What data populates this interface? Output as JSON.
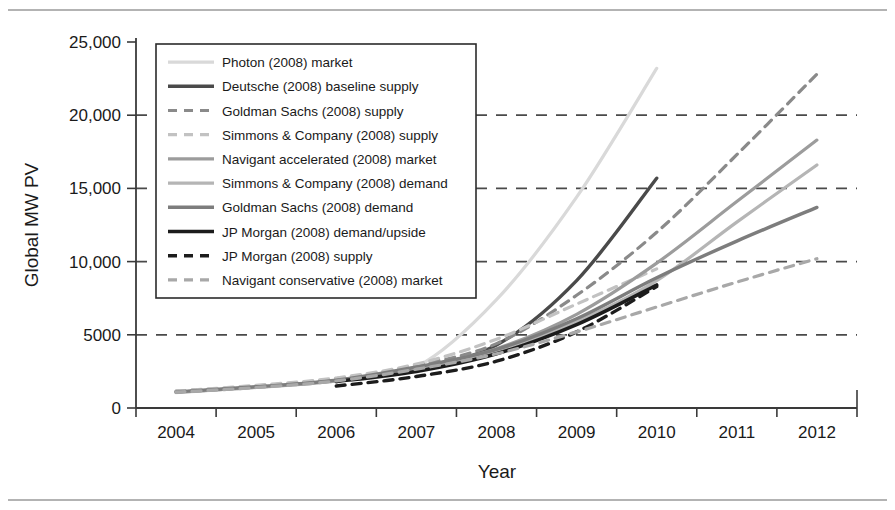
{
  "chart_data": {
    "type": "line",
    "title": "",
    "xlabel": "Year",
    "ylabel": "Global MW PV",
    "x": [
      2004,
      2005,
      2006,
      2007,
      2008,
      2009,
      2010,
      2011,
      2012
    ],
    "xticklabels": [
      "2004",
      "2005",
      "2006",
      "2007",
      "2008",
      "2009",
      "2010",
      "2011",
      "2012"
    ],
    "yticklabels": [
      "0",
      "5000",
      "10,000",
      "15,000",
      "20,000",
      "25,000"
    ],
    "yticks": [
      0,
      5000,
      10000,
      15000,
      20000,
      25000
    ],
    "ylim": [
      0,
      25000
    ],
    "xlim": [
      2004,
      2012
    ],
    "grid": "horizontal-dashed",
    "legend_position": "upper-left-inside",
    "series": [
      {
        "name": "Photon (2008) market",
        "style": "solid",
        "color": "#d9d9d9",
        "width": 3.2,
        "x": [
          2004,
          2005,
          2006,
          2007,
          2008,
          2009,
          2010
        ],
        "values": [
          1050,
          1400,
          1850,
          2800,
          7400,
          14400,
          23200
        ]
      },
      {
        "name": "Deutsche (2008) baseline supply",
        "style": "solid",
        "color": "#4a4a4a",
        "width": 3.4,
        "x": [
          2006,
          2007,
          2008,
          2009,
          2010
        ],
        "values": [
          1850,
          2700,
          4300,
          8700,
          15700
        ]
      },
      {
        "name": "Goldman Sachs (2008) supply",
        "style": "dashed",
        "color": "#8a8a8a",
        "width": 3.2,
        "x": [
          2004,
          2005,
          2006,
          2007,
          2008,
          2009,
          2010,
          2011,
          2012
        ],
        "values": [
          1150,
          1500,
          2000,
          2900,
          4400,
          7700,
          12000,
          17300,
          22800
        ]
      },
      {
        "name": "Simmons & Company (2008) supply",
        "style": "dashed",
        "color": "#c2c2c2",
        "width": 3.2,
        "x": [
          2004,
          2005,
          2006,
          2007,
          2008,
          2009,
          2010
        ],
        "values": [
          1150,
          1550,
          2050,
          3000,
          4700,
          7100,
          9500
        ]
      },
      {
        "name": "Navigant accelerated (2008) market",
        "style": "solid",
        "color": "#9c9c9c",
        "width": 3.2,
        "x": [
          2004,
          2005,
          2006,
          2007,
          2008,
          2009,
          2010,
          2011,
          2012
        ],
        "values": [
          1080,
          1420,
          1880,
          2750,
          4050,
          6400,
          9900,
          14100,
          18300
        ]
      },
      {
        "name": "Simmons & Company (2008) demand",
        "style": "solid",
        "color": "#b5b5b5",
        "width": 3.2,
        "x": [
          2004,
          2005,
          2006,
          2007,
          2008,
          2009,
          2010,
          2011,
          2012
        ],
        "values": [
          1080,
          1400,
          1850,
          2700,
          3900,
          5900,
          8700,
          12700,
          16600
        ]
      },
      {
        "name": "Goldman Sachs (2008) demand",
        "style": "solid",
        "color": "#7d7d7d",
        "width": 3.4,
        "x": [
          2004,
          2005,
          2006,
          2007,
          2008,
          2009,
          2010,
          2011,
          2012
        ],
        "values": [
          1100,
          1450,
          1900,
          2800,
          4000,
          6100,
          8900,
          11400,
          13700
        ]
      },
      {
        "name": "JP Morgan (2008) demand/upside",
        "style": "solid",
        "color": "#1c1c1c",
        "width": 3.6,
        "x": [
          2006,
          2007,
          2008,
          2009,
          2010
        ],
        "values": [
          1800,
          2500,
          3700,
          5700,
          8400
        ]
      },
      {
        "name": "JP Morgan (2008) supply",
        "style": "dashed",
        "color": "#1c1c1c",
        "width": 3.4,
        "x": [
          2006,
          2007,
          2008,
          2009,
          2010
        ],
        "values": [
          1500,
          2150,
          3200,
          5200,
          8300
        ]
      },
      {
        "name": "Navigant conservative (2008) market",
        "style": "dashed",
        "color": "#a8a8a8",
        "width": 3.2,
        "x": [
          2004,
          2005,
          2006,
          2007,
          2008,
          2009,
          2010,
          2011,
          2012
        ],
        "values": [
          1080,
          1400,
          1850,
          2650,
          3700,
          5200,
          6900,
          8600,
          10200
        ]
      }
    ]
  }
}
